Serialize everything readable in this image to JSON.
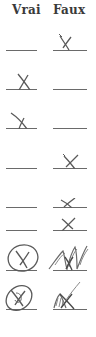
{
  "headers": {
    "true_label": "Vrai",
    "false_label": "Faux"
  },
  "rows": [
    {
      "index": 1,
      "answer": "Faux",
      "mark": "x"
    },
    {
      "index": 2,
      "answer": "Vrai",
      "mark": "x"
    },
    {
      "index": 3,
      "answer": "Vrai",
      "mark": "x"
    },
    {
      "index": 4,
      "answer": "Faux",
      "mark": "x"
    },
    {
      "index": 5,
      "answer": "Faux",
      "mark": "x"
    },
    {
      "index": 6,
      "answer": "Faux",
      "mark": "x"
    },
    {
      "index": 7,
      "answer": "Vrai",
      "mark": "circled-x",
      "crossed_out": "Faux"
    },
    {
      "index": 8,
      "answer": "Vrai",
      "mark": "circled-x",
      "crossed_out": "Faux"
    }
  ],
  "colors": {
    "ink": "#5a5a5a",
    "line": "#6a6a6a",
    "header": "#3a3a3a"
  }
}
